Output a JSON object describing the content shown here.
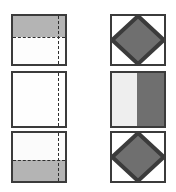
{
  "figure": {
    "width": 176,
    "height": 192,
    "background": "#ffffff",
    "outline_color": "#3b3b3b",
    "dash_color": "#2e2e2e"
  },
  "palette": {
    "white": "#ffffff",
    "near_white": "#fbfbfb",
    "light_gray": "#eeeeee",
    "medium_gray": "#b4b4b4",
    "dark_gray": "#6f6f6f",
    "outline": "#3b3b3b"
  },
  "columns": [
    {
      "name": "left-column",
      "role": "fold-steps",
      "panels": [
        {
          "name": "fold-step-1",
          "x": 11,
          "y": 14,
          "width": 56,
          "height": 52,
          "base_fill": "#fdfdfd",
          "bands": [
            {
              "name": "gray-band-top",
              "position": "top",
              "size_pct": 45,
              "fill": "#b4b4b4"
            }
          ],
          "dashed_lines": [
            {
              "name": "horizontal-fold-line",
              "orientation": "horizontal",
              "position_pct": 45
            },
            {
              "name": "vertical-fold-line",
              "orientation": "vertical",
              "position_pct": 84
            }
          ]
        },
        {
          "name": "fold-step-2",
          "x": 11,
          "y": 71,
          "width": 56,
          "height": 57,
          "base_fill": "#fefefe",
          "bands": [],
          "dashed_lines": [
            {
              "name": "vertical-fold-line",
              "orientation": "vertical",
              "position_pct": 84
            }
          ]
        },
        {
          "name": "fold-step-3",
          "x": 11,
          "y": 131,
          "width": 56,
          "height": 52,
          "base_fill": "#fbfbfb",
          "bands": [
            {
              "name": "gray-band-bottom",
              "position": "bottom",
              "size_pct": 45,
              "fill": "#b4b4b4"
            }
          ],
          "dashed_lines": [
            {
              "name": "horizontal-fold-line",
              "orientation": "horizontal",
              "position_pct": 55
            },
            {
              "name": "vertical-fold-line",
              "orientation": "vertical",
              "position_pct": 84
            }
          ]
        }
      ]
    },
    {
      "name": "right-column",
      "role": "answer-options",
      "panels": [
        {
          "name": "option-1-diamond",
          "x": 110,
          "y": 14,
          "width": 56,
          "height": 52,
          "base_fill": "#ffffff",
          "shape": {
            "name": "diamond",
            "fill": "#6f6f6f",
            "stroke": "#3b3b3b"
          }
        },
        {
          "name": "option-2-vertical-split",
          "x": 110,
          "y": 71,
          "width": 56,
          "height": 57,
          "base_fill": "#ffffff",
          "halves": [
            {
              "name": "left-half",
              "side": "left",
              "size_pct": 48,
              "fill": "#eeeeee"
            },
            {
              "name": "right-half",
              "side": "right",
              "size_pct": 52,
              "fill": "#6f6f6f"
            }
          ]
        },
        {
          "name": "option-3-diamond",
          "x": 110,
          "y": 131,
          "width": 56,
          "height": 52,
          "base_fill": "#ffffff",
          "shape": {
            "name": "diamond",
            "fill": "#6f6f6f",
            "stroke": "#3b3b3b"
          }
        }
      ]
    }
  ]
}
